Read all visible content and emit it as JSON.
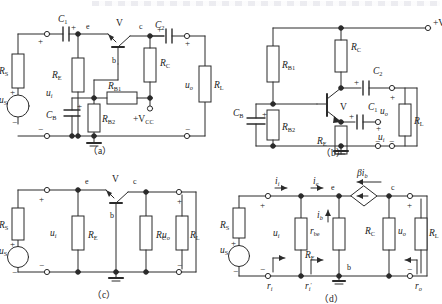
{
  "figure": {
    "title_strip": "",
    "panels": [
      {
        "id": "a",
        "caption": "（a）",
        "name": "common-base-amplifier-full-circuit",
        "components": [
          {
            "ref": "C",
            "sub": "1",
            "type": "capacitor-polarized",
            "name": "capacitor-c1"
          },
          {
            "ref": "C",
            "sub": "2",
            "type": "capacitor-polarized",
            "name": "capacitor-c2"
          },
          {
            "ref": "C",
            "sub": "B",
            "type": "capacitor-polarized",
            "name": "capacitor-cb"
          },
          {
            "ref": "R",
            "sub": "S",
            "type": "resistor",
            "name": "resistor-rs"
          },
          {
            "ref": "R",
            "sub": "E",
            "type": "resistor",
            "name": "resistor-re"
          },
          {
            "ref": "R",
            "sub": "C",
            "type": "resistor",
            "name": "resistor-rc"
          },
          {
            "ref": "R",
            "sub": "L",
            "type": "resistor",
            "name": "resistor-rl"
          },
          {
            "ref": "R",
            "sub": "B1",
            "type": "resistor",
            "name": "resistor-rb1"
          },
          {
            "ref": "R",
            "sub": "B2",
            "type": "resistor",
            "name": "resistor-rb2"
          },
          {
            "ref": "u",
            "sub": "S",
            "type": "voltage-source",
            "name": "source-us"
          },
          {
            "ref": "u",
            "sub": "i",
            "type": "node-voltage",
            "name": "voltage-ui"
          },
          {
            "ref": "u",
            "sub": "o",
            "type": "node-voltage",
            "name": "voltage-uo"
          },
          {
            "ref": "V",
            "sub": "",
            "type": "bjt",
            "name": "transistor-v"
          }
        ],
        "nodes": [
          "e",
          "b",
          "c"
        ],
        "supply": "+V",
        "supply_sub": "CC"
      },
      {
        "id": "b",
        "caption": "（b）",
        "name": "common-base-amplifier-redrawn",
        "components": [
          {
            "ref": "C",
            "sub": "1",
            "type": "capacitor-polarized",
            "name": "capacitor-c1"
          },
          {
            "ref": "C",
            "sub": "2",
            "type": "capacitor-polarized",
            "name": "capacitor-c2"
          },
          {
            "ref": "C",
            "sub": "B",
            "type": "capacitor-polarized",
            "name": "capacitor-cb"
          },
          {
            "ref": "R",
            "sub": "B1",
            "type": "resistor",
            "name": "resistor-rb1"
          },
          {
            "ref": "R",
            "sub": "B2",
            "type": "resistor",
            "name": "resistor-rb2"
          },
          {
            "ref": "R",
            "sub": "C",
            "type": "resistor",
            "name": "resistor-rc"
          },
          {
            "ref": "R",
            "sub": "E",
            "type": "resistor",
            "name": "resistor-re"
          },
          {
            "ref": "R",
            "sub": "L",
            "type": "resistor",
            "name": "resistor-rl"
          },
          {
            "ref": "u",
            "sub": "i",
            "type": "node-voltage",
            "name": "voltage-ui"
          },
          {
            "ref": "u",
            "sub": "o",
            "type": "node-voltage",
            "name": "voltage-uo"
          },
          {
            "ref": "V",
            "sub": "",
            "type": "bjt",
            "name": "transistor-v"
          }
        ],
        "supply": "+V",
        "supply_sub": "CC"
      },
      {
        "id": "c",
        "caption": "（c）",
        "name": "ac-equivalent-circuit",
        "components": [
          {
            "ref": "R",
            "sub": "S",
            "type": "resistor",
            "name": "resistor-rs"
          },
          {
            "ref": "R",
            "sub": "E",
            "type": "resistor",
            "name": "resistor-re"
          },
          {
            "ref": "R",
            "sub": "C",
            "type": "resistor",
            "name": "resistor-rc"
          },
          {
            "ref": "R",
            "sub": "L",
            "type": "resistor",
            "name": "resistor-rl"
          },
          {
            "ref": "u",
            "sub": "S",
            "type": "voltage-source",
            "name": "source-us"
          },
          {
            "ref": "u",
            "sub": "i",
            "type": "node-voltage",
            "name": "voltage-ui"
          },
          {
            "ref": "u",
            "sub": "o",
            "type": "node-voltage",
            "name": "voltage-uo"
          },
          {
            "ref": "V",
            "sub": "",
            "type": "bjt",
            "name": "transistor-v"
          }
        ],
        "nodes": [
          "e",
          "b",
          "c"
        ]
      },
      {
        "id": "d",
        "caption": "（d）",
        "name": "small-signal-hybrid-pi-model",
        "components": [
          {
            "ref": "R",
            "sub": "S",
            "type": "resistor",
            "name": "resistor-rs"
          },
          {
            "ref": "R",
            "sub": "E",
            "type": "resistor",
            "name": "resistor-re"
          },
          {
            "ref": "R",
            "sub": "C",
            "type": "resistor",
            "name": "resistor-rc"
          },
          {
            "ref": "R",
            "sub": "L",
            "type": "resistor",
            "name": "resistor-rl"
          },
          {
            "ref": "r",
            "sub": "be",
            "type": "resistor",
            "name": "resistor-rbe"
          },
          {
            "ref": "u",
            "sub": "S",
            "type": "voltage-source",
            "name": "source-us"
          },
          {
            "ref": "u",
            "sub": "i",
            "type": "node-voltage",
            "name": "voltage-ui"
          },
          {
            "ref": "u",
            "sub": "o",
            "type": "node-voltage",
            "name": "voltage-uo"
          }
        ],
        "currents": [
          {
            "ref": "i",
            "sub": "i",
            "name": "current-ii"
          },
          {
            "ref": "i",
            "sub": "e",
            "name": "current-ie"
          },
          {
            "ref": "i",
            "sub": "b",
            "name": "current-ib"
          }
        ],
        "dependent_source": {
          "coef": "β",
          "ref": "i",
          "sub": "b",
          "name": "dependent-current-source"
        },
        "resistances": [
          {
            "ref": "r",
            "sub": "i",
            "prime": "",
            "name": "input-resistance-ri"
          },
          {
            "ref": "r",
            "sub": "i",
            "prime": "′",
            "name": "input-resistance-ri-prime"
          },
          {
            "ref": "r",
            "sub": "o",
            "prime": "",
            "name": "output-resistance-ro"
          }
        ],
        "nodes": [
          "e",
          "c",
          "b"
        ]
      }
    ],
    "signs": {
      "plus": "+",
      "minus": "−"
    },
    "colors": {
      "line": "#2b2b2b",
      "text": "#222222",
      "background": "#ffffff"
    }
  }
}
